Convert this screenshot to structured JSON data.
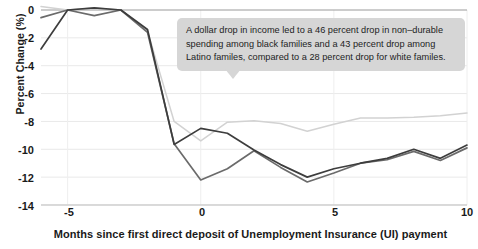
{
  "chart_data": {
    "type": "line",
    "title": "",
    "subtitle": "",
    "xlabel": "Months since first direct deposit of Unemployment Insurance (UI) payment",
    "ylabel": "Percent Change (%)",
    "xlim": [
      -6,
      10
    ],
    "ylim": [
      -14,
      0.6
    ],
    "grid": true,
    "legend_position": "none",
    "xticks": [
      "-5",
      "0",
      "5",
      "10"
    ],
    "xtick_values": [
      -5,
      0,
      5,
      10
    ],
    "yticks": [
      "0",
      "-2",
      "-4",
      "-6",
      "-8",
      "-10",
      "-12",
      "-14"
    ],
    "ytick_values": [
      0,
      -2,
      -4,
      -6,
      -8,
      -10,
      -12,
      -14
    ],
    "x": [
      -6,
      -5,
      -4,
      -3,
      -2,
      -1,
      0,
      1,
      2,
      3,
      4,
      5,
      6,
      7,
      8,
      9,
      10
    ],
    "series": [
      {
        "name": "black families",
        "color": "#3d3d3d",
        "values": [
          -2.8,
          0.0,
          0.15,
          0.0,
          -1.4,
          -9.65,
          -8.5,
          -8.85,
          -10.05,
          -11.1,
          -12.0,
          -11.4,
          -11.0,
          -10.65,
          -10.0,
          -10.65,
          -9.7
        ]
      },
      {
        "name": "Latino familes",
        "color": "#6b6b6b",
        "values": [
          -0.55,
          0.0,
          -0.4,
          0.0,
          -1.6,
          -9.6,
          -12.2,
          -11.4,
          -10.1,
          -11.3,
          -12.35,
          -11.7,
          -11.0,
          -10.75,
          -10.15,
          -10.8,
          -9.9
        ]
      },
      {
        "name": "white familes",
        "color": "#d2d2d2",
        "values": [
          0.25,
          0.0,
          0.15,
          0.0,
          -1.5,
          -8.0,
          -9.4,
          -8.05,
          -7.95,
          -8.15,
          -8.7,
          -8.2,
          -7.75,
          -7.75,
          -7.7,
          -7.6,
          -7.4
        ]
      }
    ],
    "annotation": {
      "line1": "A dollar drop in income led to a 46 percent drop in non–durable",
      "line2": "spending among black families and a 43 percent drop among",
      "line3": "Latino familes, compared to a 28 percent drop for white familes."
    }
  },
  "axes": {
    "ylabel": "Percent Change (%)",
    "xlabel": "Months since first direct deposit of Unemployment Insurance (UI) payment"
  }
}
